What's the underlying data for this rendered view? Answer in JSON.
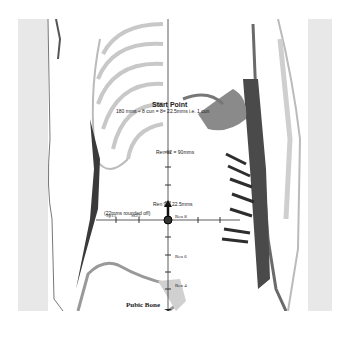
{
  "figure": {
    "title": "Start Point",
    "subtitle": "180 mms ÷ 8 cun = 8= 22.5mms i.e. 1 cun",
    "vertical_axis": {
      "top_label": "Start Point",
      "bottom_label": "Pubic Bone",
      "labels": [
        {
          "text": "Ren 12 = 90mms",
          "y": 152
        },
        {
          "text": "Ren 9 = 22.5mms",
          "y": 204
        },
        {
          "text": "(22mms rounded off)",
          "y": 212
        },
        {
          "text": "Ren 6",
          "y": 255
        },
        {
          "text": "Ren 4",
          "y": 284
        }
      ]
    },
    "horizontal_axis": {
      "labels": [
        {
          "text": "Sp15",
          "x": 108
        },
        {
          "text": "St25",
          "x": 137
        },
        {
          "text": "Ren 8",
          "x": 176
        }
      ]
    },
    "center_point": "Ren 8 (navel)",
    "colors": {
      "line": "#333333",
      "bone_light": "#c8c8c8",
      "muscle_dark": "#3a3a3a",
      "skin_gray": "#e6e6e6"
    }
  }
}
